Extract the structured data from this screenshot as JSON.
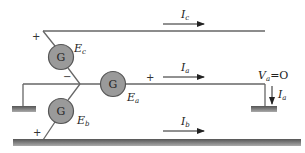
{
  "diagram": {
    "generators": [
      {
        "id": "ec",
        "symbol": "G",
        "label": "E",
        "sub": "c",
        "plus": "+",
        "minus": "−"
      },
      {
        "id": "ea",
        "symbol": "G",
        "label": "E",
        "sub": "a",
        "plus": "+"
      },
      {
        "id": "eb",
        "symbol": "G",
        "label": "E",
        "sub": "b",
        "plus": "+"
      }
    ],
    "currents": [
      {
        "id": "ic",
        "label": "I",
        "sub": "c"
      },
      {
        "id": "ia",
        "label": "I",
        "sub": "a"
      },
      {
        "id": "ib",
        "label": "I",
        "sub": "b"
      },
      {
        "id": "ia-ground",
        "label": "I",
        "sub": "a"
      }
    ],
    "voltage": {
      "label": "V",
      "sub": "a",
      "eq": "=O"
    },
    "colors": {
      "generator_fill": "#9a9a9a",
      "generator_stroke": "#555555",
      "wire": "#666666",
      "ground": "#777777"
    }
  }
}
